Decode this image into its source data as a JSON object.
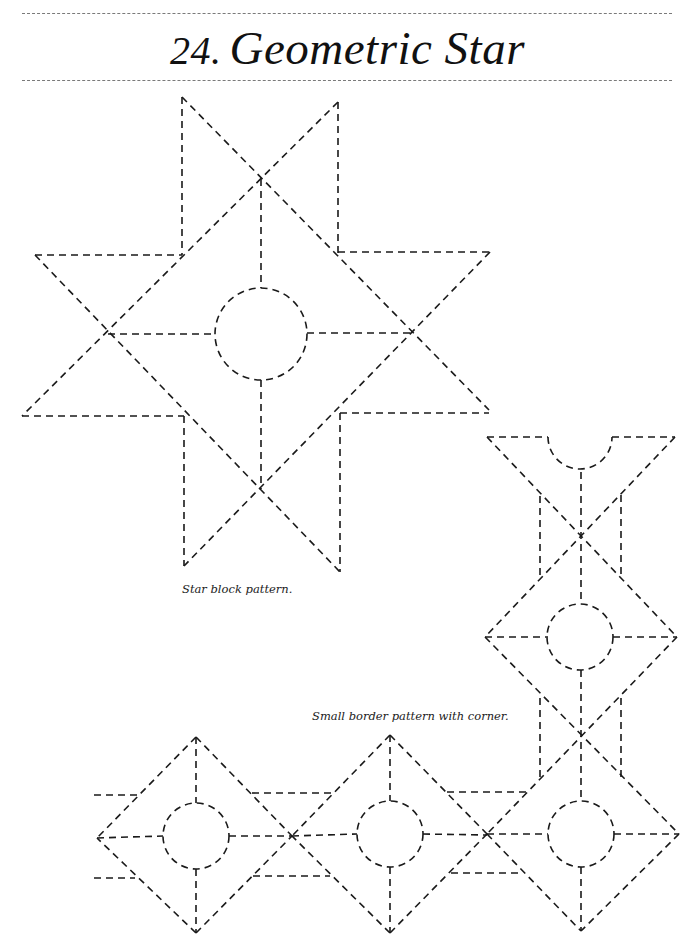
{
  "page": {
    "title_number": "24.",
    "title_text": "Geometric Star",
    "captions": {
      "star_block": "Star block pattern.",
      "border": "Small border pattern with corner."
    },
    "colors": {
      "ink": "#1a1a1a",
      "rule": "#7a7a7a",
      "background": "#ffffff"
    }
  },
  "figures": {
    "star_block": {
      "lines": [
        [
          182,
          97,
          182,
          255
        ],
        [
          338,
          102,
          338,
          253
        ],
        [
          35,
          255,
          182,
          255
        ],
        [
          338,
          252,
          490,
          252
        ],
        [
          22,
          416,
          184,
          416
        ],
        [
          340,
          413,
          489,
          413
        ],
        [
          184,
          416,
          184,
          566
        ],
        [
          340,
          413,
          340,
          572
        ],
        [
          182,
          97,
          489,
          410
        ],
        [
          338,
          102,
          22,
          416
        ],
        [
          35,
          255,
          340,
          572
        ],
        [
          490,
          252,
          184,
          566
        ],
        [
          261,
          179,
          261,
          288
        ],
        [
          261,
          380,
          261,
          489
        ],
        [
          108,
          334,
          215,
          334
        ],
        [
          307,
          333,
          412,
          333
        ]
      ],
      "circles": [
        [
          261,
          334,
          46
        ]
      ]
    },
    "border": {
      "lines": [
        [
          487,
          437,
          548,
          437
        ],
        [
          612,
          437,
          675,
          437
        ],
        [
          487,
          437,
          677,
          637
        ],
        [
          675,
          437,
          485,
          637
        ],
        [
          581,
          472,
          581,
          604
        ],
        [
          540,
          496,
          540,
          576
        ],
        [
          621,
          495,
          621,
          578
        ],
        [
          485,
          637,
          548,
          637
        ],
        [
          613,
          637,
          677,
          637
        ],
        [
          485,
          637,
          679,
          834
        ],
        [
          677,
          637,
          487,
          834
        ],
        [
          581,
          670,
          581,
          801
        ],
        [
          540,
          698,
          540,
          778
        ],
        [
          621,
          698,
          621,
          778
        ],
        [
          581,
          867,
          581,
          931
        ],
        [
          614,
          834,
          679,
          834
        ],
        [
          487,
          834,
          548,
          834
        ],
        [
          679,
          834,
          581,
          931
        ],
        [
          487,
          834,
          581,
          931
        ],
        [
          447,
          792,
          530,
          792
        ],
        [
          451,
          873,
          522,
          873
        ],
        [
          390,
          735,
          390,
          801
        ],
        [
          390,
          867,
          390,
          933
        ],
        [
          390,
          735,
          487,
          834
        ],
        [
          390,
          735,
          292,
          836
        ],
        [
          390,
          933,
          487,
          834
        ],
        [
          390,
          933,
          292,
          836
        ],
        [
          292,
          836,
          357,
          834
        ],
        [
          423,
          834,
          487,
          835
        ],
        [
          252,
          793,
          333,
          793
        ],
        [
          253,
          876,
          330,
          876
        ],
        [
          196,
          737,
          196,
          803
        ],
        [
          196,
          869,
          196,
          933
        ],
        [
          196,
          737,
          97,
          838
        ],
        [
          196,
          933,
          97,
          838
        ],
        [
          196,
          737,
          292,
          836
        ],
        [
          196,
          933,
          292,
          836
        ],
        [
          97,
          838,
          163,
          836
        ],
        [
          229,
          836,
          292,
          836
        ],
        [
          94,
          795,
          140,
          795
        ],
        [
          94,
          878,
          135,
          878
        ]
      ],
      "arcs": [
        [
          "M548,437 A32,32 0 0 0 612,437"
        ]
      ],
      "circles": [
        [
          580,
          637,
          33
        ],
        [
          581,
          834,
          33
        ],
        [
          390,
          834,
          33
        ],
        [
          196,
          836,
          33
        ]
      ]
    }
  }
}
